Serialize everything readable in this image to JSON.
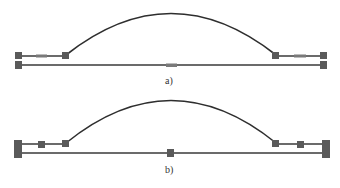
{
  "figure": {
    "colors": {
      "line": "#6b6b6b",
      "arc": "#2e2e2e",
      "block": "#5a5a5a",
      "label": "#333333"
    },
    "panels": [
      {
        "id": "a",
        "label": "a)",
        "upper_line_y": 56,
        "lower_line_y": 65,
        "arc_peak_y": 14,
        "upper_chord_element": "bar",
        "lower_center_element": "bar"
      },
      {
        "id": "b",
        "label": "b)",
        "upper_line_y": 144,
        "lower_line_y": 153,
        "arc_peak_y": 101,
        "upper_chord_element": "square",
        "lower_center_element": "square"
      }
    ]
  }
}
